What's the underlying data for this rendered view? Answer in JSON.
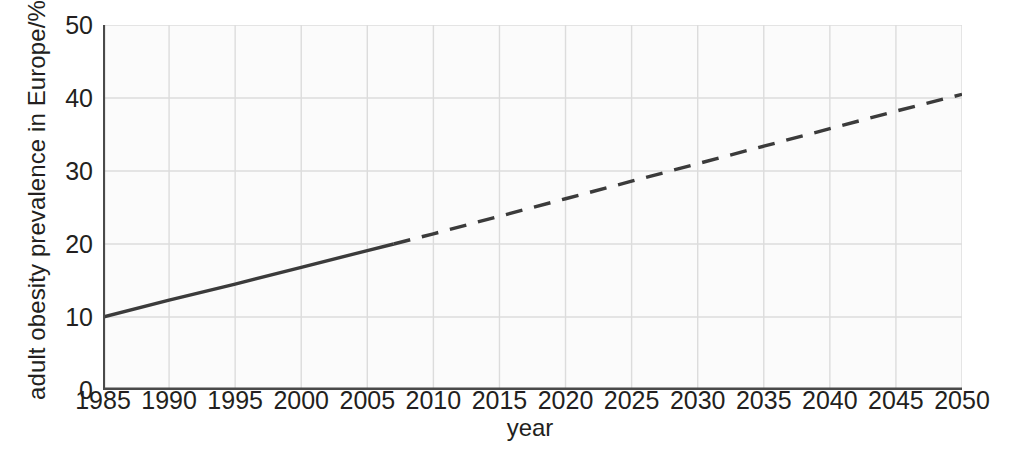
{
  "chart_data": {
    "type": "line",
    "title": "",
    "xlabel": "year",
    "ylabel": "adult obesity prevalence in Europe/%",
    "xlim": [
      1985,
      2050
    ],
    "ylim": [
      0,
      50
    ],
    "grid": true,
    "legend": false,
    "x_ticks": [
      1985,
      1990,
      1995,
      2000,
      2005,
      2010,
      2015,
      2020,
      2025,
      2030,
      2035,
      2040,
      2045,
      2050
    ],
    "y_ticks": [
      0,
      10,
      20,
      30,
      40,
      50
    ],
    "x_tick_labels": [
      "1985",
      "1990",
      "1995",
      "2000",
      "2005",
      "2010",
      "2015",
      "2020",
      "2025",
      "2030",
      "2035",
      "2040",
      "2045",
      "2050"
    ],
    "y_tick_labels": [
      "0",
      "10",
      "20",
      "30",
      "40",
      "50"
    ],
    "series": [
      {
        "name": "observed adult obesity prevalence",
        "style": "solid",
        "color": "#3b3b3b",
        "x": [
          1985,
          1990,
          1995,
          2000,
          2005,
          2007
        ],
        "values": [
          10.0,
          12.3,
          14.5,
          16.8,
          19.1,
          20.0
        ]
      },
      {
        "name": "projected adult obesity prevalence",
        "style": "dashed",
        "color": "#3b3b3b",
        "x": [
          2007,
          2010,
          2015,
          2020,
          2025,
          2030,
          2035,
          2040,
          2045,
          2050
        ],
        "values": [
          20.0,
          21.4,
          23.8,
          26.2,
          28.6,
          31.0,
          33.4,
          35.8,
          38.2,
          40.5
        ]
      }
    ],
    "annotations": [],
    "colors": {
      "line": "#3b3b3b",
      "grid": "#dcdcdc",
      "axis": "#4a4a4a",
      "plot_background": "#fbfbfb",
      "figure_background": "#ffffff",
      "text": "#231f20"
    }
  }
}
